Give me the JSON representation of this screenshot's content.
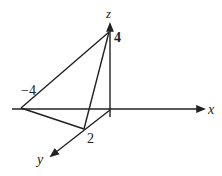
{
  "diagram": {
    "axes": {
      "x": {
        "label": "x"
      },
      "y": {
        "label": "y"
      },
      "z": {
        "label": "z"
      }
    },
    "intercepts": {
      "x": {
        "value": "−4"
      },
      "y": {
        "value": "2"
      },
      "z": {
        "value": "4"
      }
    },
    "colors": {
      "line": "#222222",
      "background": "#ffffff"
    }
  }
}
